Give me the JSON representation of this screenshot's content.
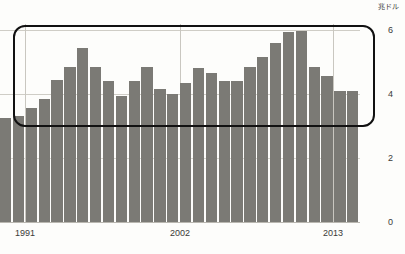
{
  "chart_data": {
    "type": "bar",
    "title": "",
    "subtitle": "",
    "xlabel": "",
    "ylabel": "兆ドル",
    "unit_label": "兆ドル",
    "ylim": [
      0,
      6.6
    ],
    "yticks": [
      0,
      2,
      4,
      6
    ],
    "ytick_labels": [
      "0",
      "2",
      "4",
      "6"
    ],
    "xticks": [
      1991,
      2002,
      2013
    ],
    "xtick_labels": [
      "1991",
      "2002",
      "2013"
    ],
    "grid": true,
    "legend": "none",
    "bar_color": "#7b7a75",
    "categories": [
      1989,
      1990,
      1991,
      1992,
      1993,
      1994,
      1995,
      1996,
      1997,
      1998,
      1999,
      2000,
      2001,
      2002,
      2003,
      2004,
      2005,
      2006,
      2007,
      2008,
      2009,
      2010,
      2011,
      2012,
      2013,
      2014,
      2015,
      2016
    ],
    "values": [
      3.25,
      3.3,
      3.55,
      3.85,
      4.45,
      4.85,
      5.45,
      4.85,
      4.4,
      3.95,
      4.4,
      4.85,
      4.15,
      4.0,
      4.35,
      4.8,
      4.65,
      4.4,
      4.42,
      4.85,
      5.15,
      5.6,
      5.95,
      5.97,
      4.85,
      4.55,
      4.1,
      4.1
    ],
    "annotations": [
      {
        "name": "highlight-rectangle",
        "shape": "rounded-rectangle",
        "color": "#111111",
        "value_range_approx": [
          3.4,
          6.6
        ],
        "description": "black rounded box drawn over the upper portion of the bars"
      }
    ]
  },
  "axis": {
    "unit": "兆ドル",
    "y_labels": [
      "6",
      "4",
      "2",
      "0"
    ],
    "x_labels": [
      "1991",
      "2002",
      "2013"
    ]
  }
}
